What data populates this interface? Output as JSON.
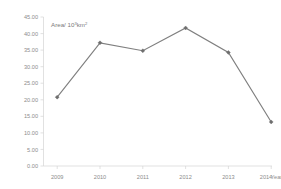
{
  "chart_data": {
    "type": "line",
    "title": "",
    "subtitle": "",
    "xlabel": "Year",
    "ylabel": "Area/ 10³km²",
    "ylabel_parts": {
      "prefix": "Area/ 10",
      "exponent": "3",
      "suffix": "km",
      "suffix_exponent": "2"
    },
    "categories": [
      "2009",
      "2010",
      "2011",
      "2012",
      "2013",
      "2014"
    ],
    "x": [
      2009,
      2010,
      2011,
      2012,
      2013,
      2014
    ],
    "values": [
      20.8,
      37.2,
      34.8,
      41.7,
      34.3,
      13.3
    ],
    "series": [
      {
        "name": "Area",
        "values": [
          20.8,
          37.2,
          34.8,
          41.7,
          34.3,
          13.3
        ]
      }
    ],
    "ylim": [
      0,
      45
    ],
    "ytick_step": 5,
    "ytick_labels": [
      "0.00",
      "5.00",
      "10.00",
      "15.00",
      "20.00",
      "25.00",
      "30.00",
      "35.00",
      "40.00",
      "45.00"
    ],
    "ytick_values": [
      0,
      5,
      10,
      15,
      20,
      25,
      30,
      35,
      40,
      45
    ],
    "xtick_labels": [
      "2009",
      "2010",
      "2011",
      "2012",
      "2013",
      "2014"
    ],
    "x_axis_suffix_label": "Year",
    "grid": false,
    "legend": false,
    "legend_position": "none",
    "marker": "diamond",
    "colors": {
      "line": "#7f7f7f",
      "marker": "#6e6e6e",
      "axis": "#d4d4d4",
      "tick_text": "#8c8c8c",
      "axis_title_text": "#7a7a7a",
      "background": "#ffffff"
    }
  }
}
